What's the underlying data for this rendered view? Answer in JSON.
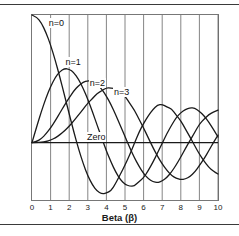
{
  "figure": {
    "name": "bessel-function-chart",
    "background": "#ffffff",
    "rule_color": "#3a3a3a"
  },
  "chart_data": {
    "type": "line",
    "title": "",
    "xlabel": "Beta (β)",
    "ylabel": "Amplitude",
    "xlim": [
      0,
      10
    ],
    "ylim": [
      -0.45,
      1.0
    ],
    "grid": true,
    "grid_axis": "x",
    "legend_position": "inline-annotations",
    "xticks": [
      0,
      1,
      2,
      3,
      4,
      5,
      6,
      7,
      8,
      9,
      10
    ],
    "xticklabels": [
      "0",
      "1",
      "2",
      "3",
      "4",
      "5",
      "6",
      "7",
      "8",
      "9",
      "10"
    ],
    "yticks": [],
    "yticklabels": [],
    "zero_line": {
      "label": "Zero",
      "value": 0,
      "color": "#1a1a1a"
    },
    "line_color": "#1a1a1a",
    "x": [
      0,
      0.25,
      0.5,
      0.75,
      1,
      1.25,
      1.5,
      1.75,
      2,
      2.25,
      2.5,
      2.75,
      3,
      3.25,
      3.5,
      3.75,
      4,
      4.25,
      4.5,
      4.75,
      5,
      5.25,
      5.5,
      5.75,
      6,
      6.25,
      6.5,
      6.75,
      7,
      7.25,
      7.5,
      7.75,
      8,
      8.25,
      8.5,
      8.75,
      9,
      9.25,
      9.5,
      9.75,
      10
    ],
    "series": [
      {
        "name": "n=0",
        "label": "n=0",
        "label_x": 0.85,
        "label_y": 0.94,
        "values": [
          1.0,
          0.9844,
          0.9385,
          0.8642,
          0.7652,
          0.6459,
          0.5118,
          0.369,
          0.2239,
          0.0827,
          -0.0484,
          -0.1641,
          -0.2601,
          -0.3325,
          -0.3801,
          -0.4026,
          -0.3971,
          -0.3766,
          -0.3205,
          -0.2477,
          -0.1776,
          -0.0968,
          -0.0068,
          0.0802,
          0.1506,
          0.2101,
          0.2601,
          0.2951,
          0.3001,
          0.2786,
          0.2663,
          0.2166,
          0.1717,
          0.1058,
          0.0419,
          -0.0256,
          -0.0903,
          -0.1447,
          -0.1939,
          -0.2243,
          -0.2459
        ]
      },
      {
        "name": "n=1",
        "label": "n=1",
        "label_x": 1.75,
        "label_y": 0.63,
        "values": [
          0.0,
          0.124,
          0.2423,
          0.3492,
          0.4401,
          0.5106,
          0.5579,
          0.5802,
          0.5767,
          0.5484,
          0.4971,
          0.4258,
          0.3391,
          0.2422,
          0.1374,
          0.0366,
          -0.066,
          -0.1538,
          -0.2311,
          -0.2902,
          -0.3276,
          -0.3414,
          -0.3414,
          -0.3043,
          -0.2767,
          -0.2196,
          -0.1538,
          -0.0815,
          -0.0047,
          0.07,
          0.1352,
          0.1951,
          0.2346,
          0.261,
          0.2731,
          0.2697,
          0.2453,
          0.2097,
          0.1613,
          0.1058,
          0.0435
        ]
      },
      {
        "name": "n=2",
        "label": "n=2",
        "label_x": 3.05,
        "label_y": 0.47,
        "values": [
          0.0,
          0.0078,
          0.0306,
          0.0671,
          0.1149,
          0.1711,
          0.2321,
          0.294,
          0.3528,
          0.4048,
          0.4461,
          0.4739,
          0.4861,
          0.4813,
          0.4586,
          0.4194,
          0.3641,
          0.2971,
          0.2178,
          0.1334,
          0.0466,
          -0.0379,
          -0.1173,
          -0.1846,
          -0.2429,
          -0.2833,
          -0.3074,
          -0.314,
          -0.3014,
          -0.2737,
          -0.2303,
          -0.1759,
          -0.113,
          -0.0466,
          0.0184,
          0.0799,
          0.1448,
          0.1838,
          0.2178,
          0.2395,
          0.2546
        ]
      },
      {
        "name": "n=3",
        "label": "n=3",
        "label_x": 4.35,
        "label_y": 0.4,
        "values": [
          0.0,
          0.0003,
          0.0026,
          0.0086,
          0.0196,
          0.0369,
          0.061,
          0.092,
          0.1289,
          0.1707,
          0.2162,
          0.2608,
          0.3091,
          0.3443,
          0.3856,
          0.4045,
          0.4302,
          0.4269,
          0.4244,
          0.3967,
          0.3648,
          0.308,
          0.2561,
          0.185,
          0.1148,
          0.0377,
          -0.038,
          -0.107,
          -0.1676,
          -0.217,
          -0.258,
          -0.2785,
          -0.2911,
          -0.2851,
          -0.2664,
          -0.2308,
          -0.1809,
          -0.1268,
          -0.0651,
          -0.0004,
          0.0584
        ]
      }
    ]
  }
}
